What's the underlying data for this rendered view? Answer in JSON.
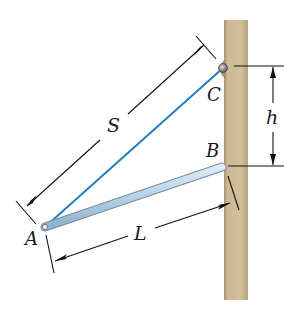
{
  "diagram": {
    "type": "statics-figure",
    "points": {
      "A": {
        "label": "A"
      },
      "B": {
        "label": "B"
      },
      "C": {
        "label": "C"
      }
    },
    "dimensions": {
      "S": {
        "label": "S",
        "from": "A",
        "to": "C",
        "description": "cable length"
      },
      "L": {
        "label": "L",
        "from": "A",
        "to": "B",
        "description": "bar length"
      },
      "h": {
        "label": "h",
        "from": "C",
        "to": "B",
        "description": "vertical separation on wall"
      }
    },
    "components": {
      "wall": {
        "color": "#c9b48f",
        "edge_color": "#a8926a"
      },
      "cable": {
        "color": "#1f7fc4"
      },
      "bar": {
        "color": "#b9d4e6",
        "edge_color": "#7d9cb3"
      },
      "pin": {
        "color": "#8a8a8a",
        "bracket_color": "#b59a6e"
      }
    }
  }
}
